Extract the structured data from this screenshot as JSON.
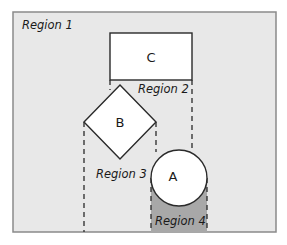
{
  "diagram": {
    "colors": {
      "background": "#e8e8e8",
      "frame_border": "#8a8a8a",
      "shape_fill": "#ffffff",
      "shape_stroke": "#2a2a2a",
      "region4_fill": "#a8a8a8",
      "dash": "#2a2a2a"
    },
    "regions": [
      {
        "id": "region1",
        "label": "Region 1"
      },
      {
        "id": "region2",
        "label": "Region 2"
      },
      {
        "id": "region3",
        "label": "Region 3"
      },
      {
        "id": "region4",
        "label": "Region 4"
      }
    ],
    "shapes": [
      {
        "id": "C",
        "type": "rectangle",
        "label": "C"
      },
      {
        "id": "B",
        "type": "diamond",
        "label": "B"
      },
      {
        "id": "A",
        "type": "circle",
        "label": "A"
      }
    ]
  }
}
